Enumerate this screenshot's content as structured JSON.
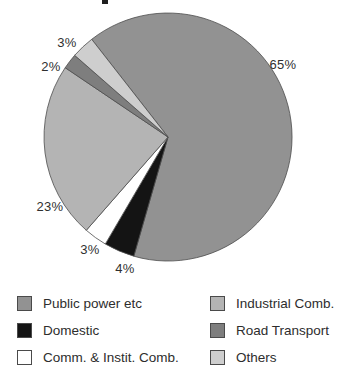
{
  "chart_data": {
    "type": "pie",
    "title": "",
    "start_angle_deg": -38,
    "clockwise": true,
    "outline_color": "#4d4d4d",
    "legend_position": "bottom",
    "legend_columns": 2,
    "legend_order": [
      0,
      3,
      1,
      4,
      2,
      5
    ],
    "geometry": {
      "cx": 168,
      "cy": 137,
      "r": 124
    },
    "slices": [
      {
        "label": "Public power etc",
        "value": 65,
        "pct_label": "65%",
        "color": "#929292",
        "label_pos": {
          "x": 283,
          "y": 64
        }
      },
      {
        "label": "Domestic",
        "value": 4,
        "pct_label": "4%",
        "color": "#141414",
        "label_pos": {
          "x": 125,
          "y": 268
        }
      },
      {
        "label": "Comm. & Instit. Comb.",
        "value": 3,
        "pct_label": "3%",
        "color": "#ffffff",
        "label_pos": {
          "x": 90,
          "y": 249
        }
      },
      {
        "label": "Industrial Comb.",
        "value": 23,
        "pct_label": "23%",
        "color": "#b4b4b4",
        "label_pos": {
          "x": 50,
          "y": 206
        }
      },
      {
        "label": "Road Transport",
        "value": 2,
        "pct_label": "2%",
        "color": "#7e7e7e",
        "label_pos": {
          "x": 51,
          "y": 66
        }
      },
      {
        "label": "Others",
        "value": 3,
        "pct_label": "3%",
        "color": "#cecece",
        "label_pos": {
          "x": 67,
          "y": 42
        }
      }
    ]
  }
}
